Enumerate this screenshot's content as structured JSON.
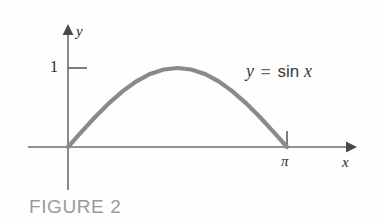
{
  "figure": {
    "caption": "FIGURE 2",
    "caption_color": "#9a9a9a",
    "background_color": "#fefefe"
  },
  "equation_label": {
    "lhs": "y",
    "operator": "=",
    "function": "sin",
    "argument": "x",
    "full_text": "y = sin x",
    "color": "#3a3a3a"
  },
  "axes": {
    "x_label": "x",
    "y_label": "y",
    "axis_color": "#6e6e6e",
    "arrow_color": "#4a4a4a",
    "x_ticks": [
      {
        "label": "π",
        "value": 3.14159
      }
    ],
    "y_ticks": [
      {
        "label": "1",
        "value": 1
      }
    ]
  },
  "chart_data": {
    "type": "line",
    "title": "FIGURE 2",
    "annotations": [
      "y = sin x"
    ],
    "xlabel": "x",
    "ylabel": "y",
    "xlim": [
      -0.6,
      4.1
    ],
    "ylim": [
      -0.62,
      1.32
    ],
    "grid": false,
    "legend": null,
    "series": [
      {
        "name": "y = sin x",
        "color": "#8a8a8a",
        "x": [
          0,
          0.19635,
          0.3927,
          0.58905,
          0.7854,
          0.98175,
          1.1781,
          1.37445,
          1.5708,
          1.76715,
          1.9635,
          2.15984,
          2.35619,
          2.55254,
          2.74889,
          2.94524,
          3.14159
        ],
        "y": [
          0,
          0.19509,
          0.38268,
          0.55557,
          0.70711,
          0.83147,
          0.92388,
          0.98079,
          1.0,
          0.98079,
          0.92388,
          0.83147,
          0.70711,
          0.55557,
          0.38268,
          0.19509,
          0
        ]
      }
    ],
    "x_tick_labels": [
      "π"
    ],
    "x_tick_values": [
      3.14159
    ],
    "y_tick_labels": [
      "1"
    ],
    "y_tick_values": [
      1
    ]
  }
}
